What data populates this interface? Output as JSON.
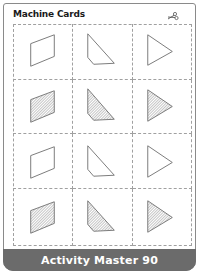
{
  "header": {
    "title": "Machine Cards",
    "icon": "scissors-icon"
  },
  "grid": {
    "columns": 3,
    "rows": 4,
    "cards": [
      {
        "row": 0,
        "col": 0,
        "shape": "parallelogram",
        "fill": "outline"
      },
      {
        "row": 0,
        "col": 1,
        "shape": "trapezoid-triangle",
        "fill": "outline"
      },
      {
        "row": 0,
        "col": 2,
        "shape": "triangle",
        "fill": "outline"
      },
      {
        "row": 1,
        "col": 0,
        "shape": "parallelogram",
        "fill": "hatched"
      },
      {
        "row": 1,
        "col": 1,
        "shape": "trapezoid-triangle",
        "fill": "hatched"
      },
      {
        "row": 1,
        "col": 2,
        "shape": "triangle",
        "fill": "hatched"
      },
      {
        "row": 2,
        "col": 0,
        "shape": "parallelogram",
        "fill": "outline"
      },
      {
        "row": 2,
        "col": 1,
        "shape": "trapezoid-triangle",
        "fill": "outline"
      },
      {
        "row": 2,
        "col": 2,
        "shape": "triangle",
        "fill": "outline"
      },
      {
        "row": 3,
        "col": 0,
        "shape": "parallelogram",
        "fill": "hatched"
      },
      {
        "row": 3,
        "col": 1,
        "shape": "trapezoid-triangle",
        "fill": "hatched"
      },
      {
        "row": 3,
        "col": 2,
        "shape": "triangle",
        "fill": "hatched"
      }
    ]
  },
  "footer": {
    "label": "Activity Master 90"
  },
  "colors": {
    "footer_bg": "#6b6b6b",
    "stroke": "#7a7a7a",
    "dashed": "#a0a0a0"
  }
}
